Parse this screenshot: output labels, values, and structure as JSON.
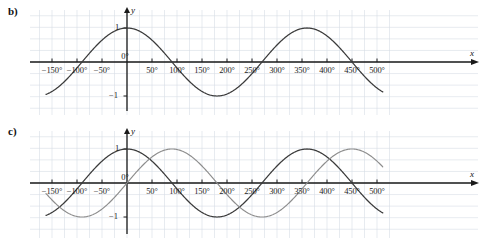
{
  "figure": {
    "panels": [
      {
        "id": "b",
        "part_label": "b)",
        "axis_x_name": "x",
        "axis_y_name": "y",
        "y_tick_labels": [
          "1",
          "−1"
        ],
        "x_tick_labels": [
          "−150°",
          "−100°",
          "−50°",
          "0°",
          "50°",
          "100°",
          "150°",
          "200°",
          "250°",
          "300°",
          "350°",
          "400°",
          "450°",
          "500°"
        ]
      },
      {
        "id": "c",
        "part_label": "c)",
        "axis_x_name": "x",
        "axis_y_name": "y",
        "y_tick_labels": [
          "1",
          "−1"
        ],
        "x_tick_labels": [
          "−150°",
          "−100°",
          "−50°",
          "0°",
          "50°",
          "100°",
          "150°",
          "200°",
          "250°",
          "300°",
          "350°",
          "400°",
          "450°",
          "500°"
        ]
      }
    ],
    "colors": {
      "curve_dark": "#3a3a3a",
      "curve_gray": "#8d8d8d",
      "axis": "#1a1a1a",
      "grid": "#d6dde6",
      "background": "#ffffff"
    }
  },
  "chart_data": [
    {
      "type": "line",
      "panel": "b",
      "title": "b)",
      "xlabel": "x",
      "ylabel": "y",
      "xlim": [
        -162,
        512
      ],
      "ylim": [
        -1.45,
        1.45
      ],
      "grid": true,
      "grid_step_deg": 25,
      "x_ticks": [
        -150,
        -100,
        -50,
        0,
        50,
        100,
        150,
        200,
        250,
        300,
        350,
        400,
        450,
        500
      ],
      "x_tick_labels": [
        "−150°",
        "−100°",
        "−50°",
        "0°",
        "50°",
        "100°",
        "150°",
        "200°",
        "250°",
        "300°",
        "350°",
        "400°",
        "450°",
        "500°"
      ],
      "y_ticks": [
        1,
        -1
      ],
      "y_tick_labels": [
        "1",
        "−1"
      ],
      "legend": [],
      "series": [
        {
          "name": "y = cos x",
          "color": "#3a3a3a",
          "function": "cos",
          "amplitude": 1,
          "period_deg": 360,
          "phase_deg": 0,
          "key_points": [
            {
              "x": -150,
              "y": -0.866
            },
            {
              "x": -90,
              "y": 0
            },
            {
              "x": 0,
              "y": 1
            },
            {
              "x": 90,
              "y": 0
            },
            {
              "x": 180,
              "y": -1
            },
            {
              "x": 270,
              "y": 0
            },
            {
              "x": 360,
              "y": 1
            },
            {
              "x": 450,
              "y": 0
            },
            {
              "x": 500,
              "y": -0.643
            }
          ]
        }
      ]
    },
    {
      "type": "line",
      "panel": "c",
      "title": "c)",
      "xlabel": "x",
      "ylabel": "y",
      "xlim": [
        -162,
        512
      ],
      "ylim": [
        -1.45,
        1.45
      ],
      "grid": true,
      "grid_step_deg": 25,
      "x_ticks": [
        -150,
        -100,
        -50,
        0,
        50,
        100,
        150,
        200,
        250,
        300,
        350,
        400,
        450,
        500
      ],
      "x_tick_labels": [
        "−150°",
        "−100°",
        "−50°",
        "0°",
        "50°",
        "100°",
        "150°",
        "200°",
        "250°",
        "300°",
        "350°",
        "400°",
        "450°",
        "500°"
      ],
      "y_ticks": [
        1,
        -1
      ],
      "y_tick_labels": [
        "1",
        "−1"
      ],
      "legend": [],
      "series": [
        {
          "name": "y = cos x",
          "color": "#3a3a3a",
          "function": "cos",
          "amplitude": 1,
          "period_deg": 360,
          "phase_deg": 0,
          "key_points": [
            {
              "x": -150,
              "y": -0.866
            },
            {
              "x": -90,
              "y": 0
            },
            {
              "x": 0,
              "y": 1
            },
            {
              "x": 90,
              "y": 0
            },
            {
              "x": 180,
              "y": -1
            },
            {
              "x": 270,
              "y": 0
            },
            {
              "x": 360,
              "y": 1
            },
            {
              "x": 450,
              "y": 0
            },
            {
              "x": 500,
              "y": -0.643
            }
          ]
        },
        {
          "name": "y = sin x",
          "color": "#8d8d8d",
          "function": "sin",
          "amplitude": 1,
          "period_deg": 360,
          "phase_deg": 0,
          "key_points": [
            {
              "x": -150,
              "y": -0.5
            },
            {
              "x": -90,
              "y": -1
            },
            {
              "x": 0,
              "y": 0
            },
            {
              "x": 90,
              "y": 1
            },
            {
              "x": 180,
              "y": 0
            },
            {
              "x": 270,
              "y": -1
            },
            {
              "x": 360,
              "y": 0
            },
            {
              "x": 450,
              "y": 1
            },
            {
              "x": 500,
              "y": 0.766
            }
          ]
        }
      ]
    }
  ]
}
